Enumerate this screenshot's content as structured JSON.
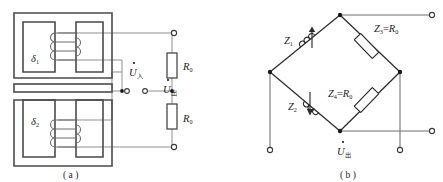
{
  "figure": {
    "panels": [
      {
        "id": "a",
        "caption": "( a )",
        "description": "Differential variable-gap inductive sensor with two E-type cores, a common armature and two balancing resistors",
        "labels": {
          "gap_top": "δ",
          "gap_top_sub": "1",
          "gap_bottom": "δ",
          "gap_bottom_sub": "2",
          "resistor_top": "R",
          "resistor_top_sub": "0",
          "resistor_bottom": "R",
          "resistor_bottom_sub": "0",
          "voltage_in": "U",
          "voltage_in_sub": "入",
          "voltage_out": "U",
          "voltage_out_sub": "出"
        }
      },
      {
        "id": "b",
        "caption": "( b )",
        "description": "Equivalent AC bridge: two variable inductive arms Z1, Z2 and two fixed resistive arms Z3, Z4",
        "labels": {
          "arm1": "Z",
          "arm1_sub": "1",
          "arm2": "Z",
          "arm2_sub": "2",
          "arm3": "Z",
          "arm3_sub": "3",
          "arm3_eq": "=",
          "arm3_value": "R",
          "arm3_value_sub": "0",
          "arm4": "Z",
          "arm4_sub": "4",
          "arm4_eq": "=",
          "arm4_value": "R",
          "arm4_value_sub": "0",
          "voltage_out": "U",
          "voltage_out_sub": "出"
        }
      }
    ],
    "colors": {
      "core_outline": "#3a3a3a",
      "wire": "#8a8a8a",
      "bridge_line": "#2b2b2b",
      "node_fill": "#1a1a1a",
      "terminal_fill": "#ffffff",
      "text": "#1a1a1a",
      "background": "#ffffff"
    }
  }
}
